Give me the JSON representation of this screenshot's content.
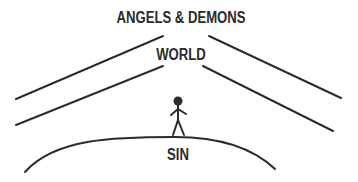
{
  "diagram": {
    "labels": {
      "top": "ANGELS & DEMONS",
      "middle": "WORLD",
      "bottom": "SIN"
    },
    "colors": {
      "ink": "#2b2b2b",
      "background": "#ffffff"
    },
    "elements": [
      {
        "type": "line-pair-left",
        "description": "two parallel diagonal lines rising toward the center"
      },
      {
        "type": "line-pair-right",
        "description": "two parallel diagonal lines descending from the center"
      },
      {
        "type": "arc",
        "description": "curved ground line (hill)"
      },
      {
        "type": "stick-figure",
        "description": "person standing on top of the arc"
      }
    ]
  }
}
